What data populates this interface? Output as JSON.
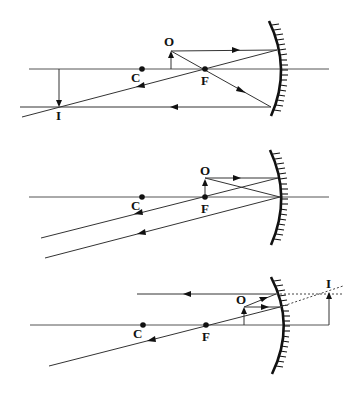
{
  "figure": {
    "panels": [
      {
        "id": "concave-object-beyond-F",
        "mirror_type": "concave",
        "labels": {
          "object": "O",
          "image": "I",
          "center": "C",
          "focus": "F"
        }
      },
      {
        "id": "concave-object-at-F",
        "mirror_type": "concave",
        "labels": {
          "object": "O",
          "center": "C",
          "focus": "F"
        }
      },
      {
        "id": "concave-object-within-F",
        "mirror_type": "concave",
        "labels": {
          "object": "O",
          "image": "I",
          "center": "C",
          "focus": "F"
        }
      }
    ]
  },
  "colors": {
    "line": "#333333",
    "mirror": "#111111",
    "background": "#ffffff"
  }
}
